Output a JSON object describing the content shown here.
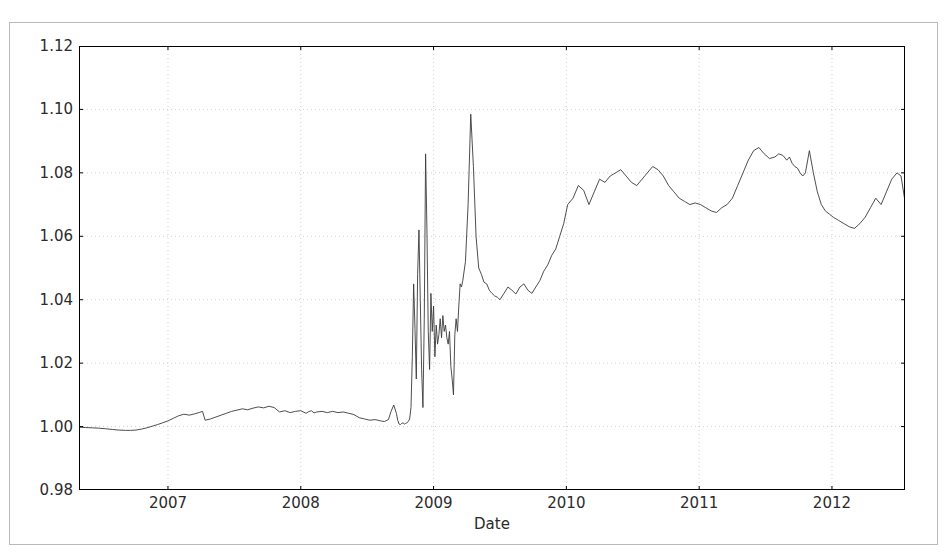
{
  "chart_data": {
    "type": "line",
    "title": "",
    "xlabel": "Date",
    "ylabel": "",
    "grid": true,
    "legend": null,
    "line_color": "#3a3a3a",
    "grid_color": "#d0d0d0",
    "axis_color": "#000000",
    "background": "#ffffff",
    "xlim": [
      2006.33,
      2012.55
    ],
    "ylim": [
      0.98,
      1.12
    ],
    "xticks": [
      2007,
      2008,
      2009,
      2010,
      2011,
      2012
    ],
    "xtick_labels": [
      "2007",
      "2008",
      "2009",
      "2010",
      "2011",
      "2012"
    ],
    "yticks": [
      0.98,
      1.0,
      1.02,
      1.04,
      1.06,
      1.08,
      1.1,
      1.12
    ],
    "ytick_labels": [
      "0.98",
      "1.00",
      "1.02",
      "1.04",
      "1.06",
      "1.08",
      "1.10",
      "1.12"
    ],
    "x": [
      2006.33,
      2006.38,
      2006.43,
      2006.48,
      2006.53,
      2006.58,
      2006.63,
      2006.68,
      2006.72,
      2006.76,
      2006.8,
      2006.84,
      2006.88,
      2006.92,
      2006.96,
      2007.0,
      2007.04,
      2007.08,
      2007.12,
      2007.16,
      2007.2,
      2007.24,
      2007.26,
      2007.28,
      2007.32,
      2007.36,
      2007.4,
      2007.44,
      2007.48,
      2007.52,
      2007.56,
      2007.6,
      2007.64,
      2007.68,
      2007.72,
      2007.76,
      2007.8,
      2007.84,
      2007.88,
      2007.92,
      2007.96,
      2008.0,
      2008.04,
      2008.06,
      2008.08,
      2008.1,
      2008.12,
      2008.16,
      2008.2,
      2008.24,
      2008.28,
      2008.32,
      2008.36,
      2008.4,
      2008.44,
      2008.48,
      2008.52,
      2008.56,
      2008.6,
      2008.63,
      2008.66,
      2008.68,
      2008.7,
      2008.72,
      2008.73,
      2008.74,
      2008.75,
      2008.76,
      2008.77,
      2008.78,
      2008.79,
      2008.8,
      2008.81,
      2008.82,
      2008.83,
      2008.84,
      2008.85,
      2008.86,
      2008.87,
      2008.88,
      2008.89,
      2008.9,
      2008.91,
      2008.92,
      2008.93,
      2008.94,
      2008.95,
      2008.96,
      2008.97,
      2008.98,
      2008.99,
      2009.0,
      2009.01,
      2009.02,
      2009.03,
      2009.04,
      2009.05,
      2009.06,
      2009.07,
      2009.08,
      2009.09,
      2009.1,
      2009.11,
      2009.12,
      2009.13,
      2009.14,
      2009.15,
      2009.16,
      2009.17,
      2009.18,
      2009.19,
      2009.2,
      2009.21,
      2009.22,
      2009.24,
      2009.26,
      2009.28,
      2009.3,
      2009.32,
      2009.34,
      2009.36,
      2009.38,
      2009.4,
      2009.42,
      2009.44,
      2009.46,
      2009.48,
      2009.5,
      2009.53,
      2009.56,
      2009.59,
      2009.62,
      2009.65,
      2009.68,
      2009.71,
      2009.74,
      2009.77,
      2009.8,
      2009.83,
      2009.86,
      2009.89,
      2009.92,
      2009.95,
      2009.98,
      2010.01,
      2010.05,
      2010.09,
      2010.13,
      2010.17,
      2010.21,
      2010.25,
      2010.29,
      2010.33,
      2010.37,
      2010.41,
      2010.45,
      2010.49,
      2010.53,
      2010.57,
      2010.61,
      2010.65,
      2010.69,
      2010.73,
      2010.77,
      2010.81,
      2010.85,
      2010.89,
      2010.93,
      2010.97,
      2011.01,
      2011.05,
      2011.09,
      2011.13,
      2011.17,
      2011.21,
      2011.25,
      2011.29,
      2011.33,
      2011.37,
      2011.41,
      2011.45,
      2011.49,
      2011.53,
      2011.57,
      2011.6,
      2011.63,
      2011.66,
      2011.68,
      2011.7,
      2011.72,
      2011.74,
      2011.76,
      2011.78,
      2011.8,
      2011.83,
      2011.86,
      2011.89,
      2011.92,
      2011.95,
      2011.98,
      2012.01,
      2012.05,
      2012.09,
      2012.13,
      2012.17,
      2012.21,
      2012.25,
      2012.29,
      2012.33,
      2012.37,
      2012.41,
      2012.45,
      2012.49,
      2012.52,
      2012.55
    ],
    "y": [
      0.9998,
      0.9997,
      0.9996,
      0.9995,
      0.9993,
      0.9991,
      0.9989,
      0.9988,
      0.9988,
      0.9989,
      0.9992,
      0.9996,
      1.0001,
      1.0006,
      1.0012,
      1.0018,
      1.0026,
      1.0034,
      1.0039,
      1.0036,
      1.004,
      1.0045,
      1.0048,
      1.002,
      1.0024,
      1.003,
      1.0036,
      1.0042,
      1.0048,
      1.0052,
      1.0056,
      1.0053,
      1.0058,
      1.0062,
      1.0059,
      1.0064,
      1.006,
      1.0046,
      1.005,
      1.0044,
      1.0048,
      1.005,
      1.0042,
      1.0047,
      1.005,
      1.0043,
      1.0046,
      1.0048,
      1.0044,
      1.0048,
      1.0044,
      1.0046,
      1.0042,
      1.0038,
      1.0028,
      1.0024,
      1.002,
      1.0022,
      1.0018,
      1.0016,
      1.0022,
      1.0048,
      1.0068,
      1.0042,
      1.002,
      1.0008,
      1.0006,
      1.001,
      1.0012,
      1.0008,
      1.001,
      1.0012,
      1.0016,
      1.0024,
      1.006,
      1.022,
      1.045,
      1.031,
      1.015,
      1.048,
      1.062,
      1.04,
      1.018,
      1.006,
      1.034,
      1.086,
      1.062,
      1.03,
      1.018,
      1.042,
      1.03,
      1.038,
      1.022,
      1.032,
      1.026,
      1.029,
      1.034,
      1.028,
      1.035,
      1.03,
      1.032,
      1.028,
      1.026,
      1.03,
      1.019,
      1.015,
      1.01,
      1.029,
      1.034,
      1.03,
      1.038,
      1.045,
      1.044,
      1.046,
      1.052,
      1.07,
      1.0985,
      1.082,
      1.06,
      1.05,
      1.048,
      1.0455,
      1.045,
      1.043,
      1.042,
      1.0412,
      1.0408,
      1.04,
      1.042,
      1.044,
      1.043,
      1.0418,
      1.044,
      1.045,
      1.043,
      1.042,
      1.044,
      1.046,
      1.049,
      1.051,
      1.054,
      1.056,
      1.06,
      1.064,
      1.07,
      1.072,
      1.076,
      1.0745,
      1.07,
      1.074,
      1.078,
      1.077,
      1.079,
      1.08,
      1.081,
      1.079,
      1.077,
      1.076,
      1.078,
      1.08,
      1.082,
      1.081,
      1.079,
      1.076,
      1.074,
      1.072,
      1.071,
      1.07,
      1.0705,
      1.07,
      1.069,
      1.068,
      1.0675,
      1.069,
      1.07,
      1.072,
      1.076,
      1.08,
      1.084,
      1.087,
      1.088,
      1.086,
      1.0845,
      1.085,
      1.086,
      1.0855,
      1.084,
      1.085,
      1.083,
      1.082,
      1.0815,
      1.08,
      1.079,
      1.08,
      1.087,
      1.08,
      1.074,
      1.07,
      1.068,
      1.067,
      1.066,
      1.065,
      1.064,
      1.063,
      1.0625,
      1.064,
      1.066,
      1.069,
      1.072,
      1.07,
      1.074,
      1.078,
      1.08,
      1.079,
      1.071
    ]
  },
  "figure": {
    "axis_title_x": "Date"
  }
}
